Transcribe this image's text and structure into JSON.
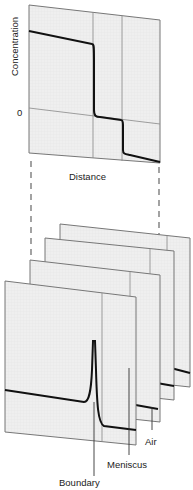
{
  "top_plot": {
    "y_axis_label": "Concentration",
    "zero_label": "0",
    "x_axis_label": "Distance"
  },
  "stack": {
    "panel_count": 4,
    "labels": {
      "air": "Air",
      "meniscus": "Meniscus",
      "boundary": "Boundary"
    }
  },
  "colors": {
    "panel_fill": "#eeeeee",
    "panel_edge": "#777777",
    "curve": "#111111",
    "dash": "#666666"
  }
}
